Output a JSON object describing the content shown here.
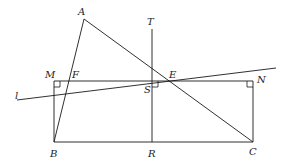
{
  "diagram": {
    "type": "geometry",
    "background": "#ffffff",
    "stroke_color": "#1a1a1a",
    "points": {
      "A": {
        "label": "A",
        "x": 84,
        "y": 19,
        "lx": 78,
        "ly": 15
      },
      "T": {
        "label": "T",
        "x": 152,
        "y": 29,
        "lx": 147,
        "ly": 25
      },
      "M": {
        "label": "M",
        "x": 54,
        "y": 81,
        "lx": 45,
        "ly": 78
      },
      "F": {
        "label": "F",
        "x": 70,
        "y": 81,
        "lx": 72,
        "ly": 78
      },
      "E": {
        "label": "E",
        "x": 169,
        "y": 81,
        "lx": 169,
        "ly": 78
      },
      "N": {
        "label": "N",
        "x": 253,
        "y": 81,
        "lx": 257,
        "ly": 83
      },
      "S": {
        "label": "S",
        "x": 152,
        "y": 81,
        "lx": 144,
        "ly": 93
      },
      "B": {
        "label": "B",
        "x": 54,
        "y": 142,
        "lx": 50,
        "ly": 157
      },
      "R": {
        "label": "R",
        "x": 152,
        "y": 142,
        "lx": 148,
        "ly": 157
      },
      "C": {
        "label": "C",
        "x": 253,
        "y": 142,
        "lx": 249,
        "ly": 155
      },
      "l": {
        "label": "l",
        "x": 17,
        "y": 100,
        "lx": 15,
        "ly": 99
      }
    },
    "segments": [
      {
        "name": "segment-AB",
        "from": "A",
        "to": "B"
      },
      {
        "name": "segment-AC",
        "from": "A",
        "to": "C"
      },
      {
        "name": "segment-MN",
        "from": "M",
        "to": "N"
      },
      {
        "name": "segment-MB",
        "from": "M",
        "to": "B"
      },
      {
        "name": "segment-NC",
        "from": "N",
        "to": "C"
      },
      {
        "name": "segment-BC",
        "from": "B",
        "to": "C"
      },
      {
        "name": "segment-TR",
        "from": "T",
        "to": "R"
      }
    ],
    "line_l": {
      "x1": 17,
      "y1": 100,
      "x2": 276,
      "y2": 68
    },
    "right_angles": [
      {
        "name": "right-angle-M",
        "at": "M"
      },
      {
        "name": "right-angle-S",
        "at": "S"
      },
      {
        "name": "right-angle-N",
        "at": "N"
      }
    ]
  }
}
